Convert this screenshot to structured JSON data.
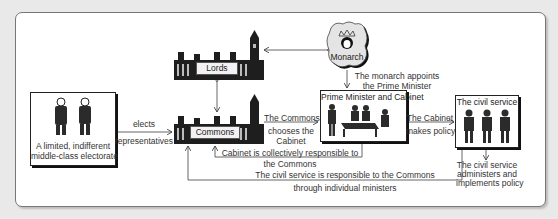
{
  "diagram": {
    "nodes": {
      "electorate": {
        "caption_line1": "A limited, indifferent",
        "caption_line2": "middle-class electorate"
      },
      "lords": {
        "label": "Lords"
      },
      "commons": {
        "label": "Commons"
      },
      "monarch": {
        "label": "Monarch"
      },
      "cabinet": {
        "title": "Prime Minister and Cabinet"
      },
      "civil_service": {
        "title": "The civil service"
      }
    },
    "edges": {
      "elects": {
        "line1": "elects",
        "line2": "representatives"
      },
      "monarch_appoints": {
        "line1": "The monarch appoints",
        "line2": "the Prime Minister"
      },
      "commons_chooses": {
        "line1": "The Commons",
        "line2": "chooses the",
        "line3": "Cabinet"
      },
      "cabinet_policy": {
        "line1": "The Cabinet",
        "line2": "makes policy"
      },
      "cabinet_responsible": {
        "line1": "Cabinet is collectively responsible to",
        "line2": "the Commons"
      },
      "civil_responsible": {
        "line1": "The civil service is responsible to the Commons",
        "line2": "through individual ministers"
      },
      "civil_administers": {
        "line1": "The civil service",
        "line2": "administers and",
        "line3": "implements policy"
      }
    }
  }
}
